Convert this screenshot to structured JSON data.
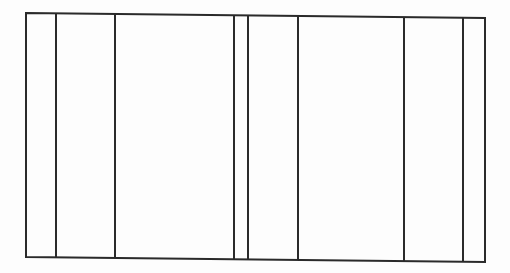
{
  "diagram": {
    "type": "rectangle-divided-into-vertical-strips",
    "stroke_color": "#2a2a2a",
    "background": "#fdfdfd",
    "outline": {
      "top_left": [
        26,
        13
      ],
      "top_right": [
        485,
        18
      ],
      "bottom_right": [
        485,
        262
      ],
      "bottom_left": [
        26,
        257
      ]
    },
    "divider_x_positions": [
      56,
      115,
      234,
      248,
      298,
      404,
      463
    ],
    "strip_count": 8
  }
}
